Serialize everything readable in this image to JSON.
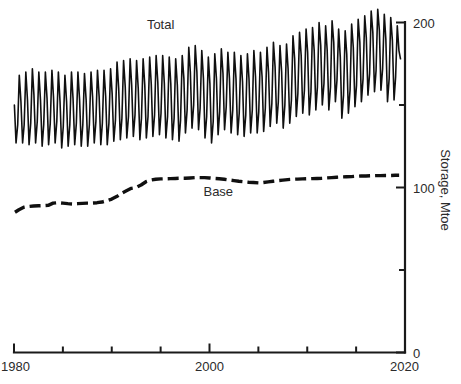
{
  "chart_data": {
    "type": "line",
    "title": "",
    "subtitle": "",
    "xlabel": "",
    "ylabel": "Storage, Mtoe",
    "xlim": [
      1980,
      2020
    ],
    "ylim": [
      0,
      215
    ],
    "grid": false,
    "legend_position": "inline-annotation",
    "x_ticks_major": [
      1980,
      2000,
      2020
    ],
    "x_tick_labels": [
      "1980",
      "2000",
      "2020"
    ],
    "x_ticks_minor": [
      1985,
      1990,
      1995,
      2005,
      2010,
      2015
    ],
    "y_ticks_major": [
      0,
      100,
      200
    ],
    "y_tick_labels": [
      "0",
      "100",
      "200"
    ],
    "y_ticks_minor": [
      50,
      150
    ],
    "y_axis_side": "right",
    "annotations": [
      {
        "text": "Total",
        "x": 1995.0,
        "y": 196.0
      },
      {
        "text": "Base",
        "x": 2000.9,
        "y": 95.0
      }
    ],
    "series": [
      {
        "name": "Total",
        "style": "solid",
        "description": "Monthly total gas storage, strong seasonal oscillation with rising trend",
        "x": [
          1980.04,
          1980.21,
          1980.38,
          1980.54,
          1980.71,
          1980.88,
          1981.04,
          1981.21,
          1981.38,
          1981.54,
          1981.71,
          1981.88,
          1982.04,
          1982.21,
          1982.38,
          1982.54,
          1982.71,
          1982.88,
          1983.04,
          1983.21,
          1983.38,
          1983.54,
          1983.71,
          1983.88,
          1984.04,
          1984.21,
          1984.38,
          1984.54,
          1984.71,
          1984.88,
          1985.04,
          1985.21,
          1985.38,
          1985.54,
          1985.71,
          1985.88,
          1986.04,
          1986.21,
          1986.38,
          1986.54,
          1986.71,
          1986.88,
          1987.04,
          1987.21,
          1987.38,
          1987.54,
          1987.71,
          1987.88,
          1988.04,
          1988.21,
          1988.38,
          1988.54,
          1988.71,
          1988.88,
          1989.04,
          1989.21,
          1989.38,
          1989.54,
          1989.71,
          1989.88,
          1990.04,
          1990.21,
          1990.38,
          1990.54,
          1990.71,
          1990.88,
          1991.04,
          1991.21,
          1991.38,
          1991.54,
          1991.71,
          1991.88,
          1992.04,
          1992.21,
          1992.38,
          1992.54,
          1992.71,
          1992.88,
          1993.04,
          1993.21,
          1993.38,
          1993.54,
          1993.71,
          1993.88,
          1994.04,
          1994.21,
          1994.38,
          1994.54,
          1994.71,
          1994.88,
          1995.04,
          1995.21,
          1995.38,
          1995.54,
          1995.71,
          1995.88,
          1996.04,
          1996.21,
          1996.38,
          1996.54,
          1996.71,
          1996.88,
          1997.04,
          1997.21,
          1997.38,
          1997.54,
          1997.71,
          1997.88,
          1998.04,
          1998.21,
          1998.38,
          1998.54,
          1998.71,
          1998.88,
          1999.04,
          1999.21,
          1999.38,
          1999.54,
          1999.71,
          1999.88,
          2000.04,
          2000.21,
          2000.38,
          2000.54,
          2000.71,
          2000.88,
          2001.04,
          2001.21,
          2001.38,
          2001.54,
          2001.71,
          2001.88,
          2002.04,
          2002.21,
          2002.38,
          2002.54,
          2002.71,
          2002.88,
          2003.04,
          2003.21,
          2003.38,
          2003.54,
          2003.71,
          2003.88,
          2004.04,
          2004.21,
          2004.38,
          2004.54,
          2004.71,
          2004.88,
          2005.04,
          2005.21,
          2005.38,
          2005.54,
          2005.71,
          2005.88,
          2006.04,
          2006.21,
          2006.38,
          2006.54,
          2006.71,
          2006.88,
          2007.04,
          2007.21,
          2007.38,
          2007.54,
          2007.71,
          2007.88,
          2008.04,
          2008.21,
          2008.38,
          2008.54,
          2008.71,
          2008.88,
          2009.04,
          2009.21,
          2009.38,
          2009.54,
          2009.71,
          2009.88,
          2010.04,
          2010.21,
          2010.38,
          2010.54,
          2010.71,
          2010.88,
          2011.04,
          2011.21,
          2011.38,
          2011.54,
          2011.71,
          2011.88,
          2012.04,
          2012.21,
          2012.38,
          2012.54,
          2012.71,
          2012.88,
          2013.04,
          2013.21,
          2013.38,
          2013.54,
          2013.71,
          2013.88,
          2014.04,
          2014.21,
          2014.38,
          2014.54,
          2014.71,
          2014.88,
          2015.04,
          2015.21,
          2015.38,
          2015.54,
          2015.71,
          2015.88,
          2016.04,
          2016.21,
          2016.38,
          2016.54,
          2016.71,
          2016.88,
          2017.04,
          2017.21,
          2017.38,
          2017.54,
          2017.71,
          2017.88,
          2018.04,
          2018.21,
          2018.38,
          2018.54,
          2018.71,
          2018.88,
          2019.04,
          2019.21,
          2019.38,
          2019.54
        ],
        "y": [
          150,
          127,
          138,
          168,
          152,
          127,
          138,
          170,
          153,
          126,
          139,
          172,
          156,
          127,
          140,
          170,
          153,
          125,
          138,
          170,
          154,
          126,
          139,
          171,
          155,
          127,
          140,
          170,
          152,
          124,
          137,
          168,
          152,
          125,
          138,
          170,
          154,
          126,
          139,
          170,
          153,
          125,
          138,
          169,
          153,
          125,
          138,
          170,
          155,
          127,
          140,
          171,
          155,
          126,
          139,
          171,
          155,
          126,
          139,
          172,
          157,
          128,
          141,
          176,
          160,
          129,
          142,
          177,
          161,
          130,
          143,
          178,
          162,
          131,
          144,
          177,
          160,
          129,
          142,
          178,
          162,
          130,
          143,
          179,
          163,
          131,
          144,
          180,
          164,
          132,
          145,
          180,
          163,
          130,
          143,
          179,
          163,
          129,
          142,
          178,
          162,
          128,
          141,
          180,
          166,
          133,
          147,
          185,
          170,
          136,
          150,
          186,
          170,
          135,
          148,
          183,
          166,
          130,
          143,
          179,
          163,
          127,
          140,
          181,
          166,
          132,
          146,
          184,
          169,
          135,
          149,
          182,
          166,
          133,
          147,
          182,
          166,
          132,
          145,
          180,
          164,
          131,
          144,
          181,
          166,
          133,
          147,
          183,
          167,
          133,
          146,
          182,
          167,
          134,
          148,
          185,
          170,
          137,
          151,
          188,
          173,
          139,
          152,
          186,
          170,
          136,
          150,
          187,
          172,
          139,
          153,
          192,
          178,
          143,
          157,
          194,
          180,
          145,
          159,
          196,
          182,
          144,
          158,
          197,
          183,
          147,
          161,
          200,
          186,
          150,
          163,
          198,
          183,
          147,
          161,
          201,
          188,
          152,
          165,
          196,
          179,
          142,
          156,
          195,
          181,
          145,
          159,
          199,
          185,
          149,
          162,
          202,
          188,
          152,
          166,
          204,
          191,
          156,
          169,
          207,
          194,
          158,
          171,
          208,
          195,
          159,
          172,
          205,
          190,
          152,
          166,
          203,
          189,
          153,
          167,
          198,
          183,
          178
        ]
      },
      {
        "name": "Base",
        "style": "dashed",
        "description": "Base (cushion) gas storage, stepped increase then plateau near 105 Mtoe",
        "x": [
          1980.1,
          1980.5,
          1981.0,
          1981.5,
          1982.0,
          1982.5,
          1983.0,
          1983.5,
          1984.0,
          1984.5,
          1985.0,
          1985.5,
          1986.0,
          1986.5,
          1987.0,
          1987.5,
          1988.0,
          1988.5,
          1989.0,
          1989.5,
          1990.0,
          1990.5,
          1991.0,
          1991.5,
          1992.0,
          1992.5,
          1993.0,
          1993.5,
          1994.0,
          1994.5,
          1995.0,
          1995.5,
          1996.0,
          1996.5,
          1997.0,
          1997.5,
          1998.0,
          1998.5,
          1999.0,
          1999.5,
          2000.0,
          2000.5,
          2001.0,
          2001.5,
          2002.0,
          2002.5,
          2003.0,
          2003.5,
          2004.0,
          2004.5,
          2005.0,
          2005.5,
          2006.0,
          2006.5,
          2007.0,
          2007.5,
          2008.0,
          2008.5,
          2009.0,
          2009.5,
          2010.0,
          2010.5,
          2011.0,
          2011.5,
          2012.0,
          2012.5,
          2013.0,
          2013.5,
          2014.0,
          2014.5,
          2015.0,
          2015.5,
          2016.0,
          2016.5,
          2017.0,
          2017.5,
          2018.0,
          2018.5,
          2019.0,
          2019.4
        ],
        "y": [
          85.0,
          86.5,
          88.0,
          88.5,
          88.8,
          88.9,
          89.0,
          89.2,
          90.5,
          90.8,
          90.5,
          90.2,
          90.0,
          90.2,
          90.4,
          90.5,
          90.6,
          90.8,
          91.2,
          92.0,
          93.0,
          94.5,
          96.5,
          98.0,
          99.5,
          100.0,
          101.5,
          103.5,
          104.5,
          105.0,
          105.2,
          105.3,
          105.4,
          105.5,
          105.6,
          105.6,
          105.8,
          106.0,
          106.0,
          106.0,
          105.8,
          105.5,
          105.3,
          105.0,
          104.6,
          104.2,
          103.8,
          103.5,
          103.2,
          103.0,
          102.8,
          103.0,
          103.4,
          103.8,
          104.2,
          104.5,
          104.8,
          105.0,
          105.1,
          105.2,
          105.3,
          105.4,
          105.5,
          105.6,
          105.8,
          106.0,
          106.2,
          106.4,
          106.5,
          106.6,
          106.8,
          107.0,
          107.0,
          107.1,
          107.2,
          107.2,
          107.3,
          107.3,
          107.4,
          107.4
        ]
      }
    ]
  },
  "axis": {
    "y_title": "Storage, Mtoe"
  }
}
